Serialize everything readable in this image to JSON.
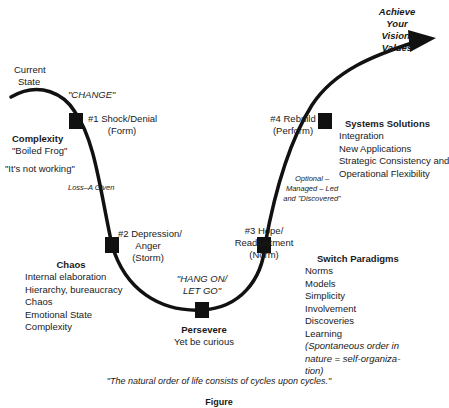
{
  "start": {
    "label_line1": "Current",
    "label_line2": "State"
  },
  "goal": {
    "line1": "Achieve",
    "line2": "Your",
    "line3": "Vision,",
    "line4": "Values"
  },
  "change_label": "\"CHANGE\"",
  "stages": [
    {
      "id": 1,
      "line1": "#1 Shock/Denial",
      "line2": "(Form)"
    },
    {
      "id": 2,
      "line1": "#2 Depression/",
      "line2": "Anger",
      "line3": "(Storm)"
    },
    {
      "id": 3,
      "line1": "#3 Hope/",
      "line2": "Readjustment",
      "line3": "(Norm)"
    },
    {
      "id": 4,
      "line1": "#4 Rebuild",
      "line2": "(Perform)"
    }
  ],
  "complexity": {
    "title": "Complexity",
    "subtitle": "\"Boiled Frog\"",
    "quote": "\"It's not working\""
  },
  "loss_label": "Loss–A Given",
  "optional_label": {
    "line1": "Optional –",
    "line2": "Managed – Led",
    "line3": "and \"Discovered\""
  },
  "hang_on": {
    "line1": "\"HANG ON/",
    "line2": "LET GO\""
  },
  "chaos": {
    "title": "Chaos",
    "items": [
      "Internal elaboration",
      "Hierarchy, bureaucracy",
      "Chaos",
      "Emotional State",
      "Complexity"
    ]
  },
  "persevere": {
    "title": "Persevere",
    "subtitle": "Yet be curious"
  },
  "switch_paradigms": {
    "title": "Switch Paradigms",
    "items": [
      "Norms",
      "Models",
      "Simplicity",
      "Involvement",
      "Discoveries",
      "Learning"
    ],
    "note_line1": "(Spontaneous order in",
    "note_line2": "nature = self-organiza-",
    "note_line3": "tion)"
  },
  "systems_solutions": {
    "title": "Systems Solutions",
    "items": [
      "Integration",
      "New Applications",
      "Strategic Consistency and",
      "Operational Flexibility"
    ]
  },
  "caption": "\"The natural order of life consists of cycles upon cycles.\"",
  "figure_label": "Figure"
}
